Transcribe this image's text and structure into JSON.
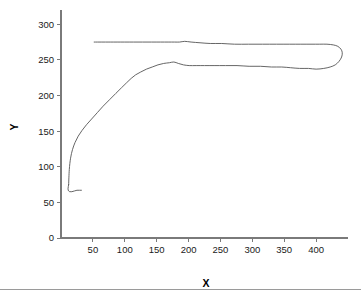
{
  "chart_data": {
    "type": "line",
    "title": "",
    "subtitle": "",
    "xlabel": "X",
    "ylabel": "Y",
    "xlim": [
      0,
      450
    ],
    "ylim": [
      0,
      320
    ],
    "grid": false,
    "legend": null,
    "legend_position": "none",
    "xticks": [
      50,
      100,
      150,
      200,
      250,
      300,
      350,
      400
    ],
    "xtick_labels": [
      "50",
      "100",
      "150",
      "200",
      "250",
      "300",
      "350",
      "400"
    ],
    "yticks": [
      0,
      50,
      100,
      150,
      200,
      250,
      300
    ],
    "ytick_labels": [
      "0",
      "50",
      "100",
      "150",
      "200",
      "250",
      "300"
    ],
    "series": [
      {
        "name": "loop",
        "closed": false,
        "comment": "Single continuous hysteresis loop traced from lower-left start, up the ascending branch, across the lower plateau, around the right-hand turn, back along the upper plateau to the left, then down to the small bottom-left hook.",
        "points": [
          [
            12,
            75
          ],
          [
            13,
            96
          ],
          [
            15,
            112
          ],
          [
            18,
            124
          ],
          [
            22,
            134
          ],
          [
            27,
            143
          ],
          [
            33,
            151
          ],
          [
            40,
            159
          ],
          [
            48,
            167
          ],
          [
            57,
            176
          ],
          [
            66,
            185
          ],
          [
            76,
            194
          ],
          [
            86,
            203
          ],
          [
            95,
            211
          ],
          [
            103,
            218
          ],
          [
            110,
            224
          ],
          [
            117,
            229
          ],
          [
            125,
            233
          ],
          [
            134,
            237
          ],
          [
            143,
            240
          ],
          [
            152,
            243
          ],
          [
            161,
            245
          ],
          [
            170,
            246
          ],
          [
            177,
            247
          ],
          [
            184,
            245
          ],
          [
            192,
            243
          ],
          [
            201,
            242
          ],
          [
            212,
            242
          ],
          [
            225,
            242
          ],
          [
            240,
            242
          ],
          [
            258,
            242
          ],
          [
            276,
            242
          ],
          [
            295,
            241
          ],
          [
            313,
            241
          ],
          [
            330,
            240
          ],
          [
            346,
            240
          ],
          [
            360,
            239
          ],
          [
            374,
            238
          ],
          [
            388,
            238
          ],
          [
            400,
            237
          ],
          [
            412,
            238
          ],
          [
            422,
            240
          ],
          [
            430,
            243
          ],
          [
            436,
            248
          ],
          [
            440,
            254
          ],
          [
            441,
            260
          ],
          [
            439,
            265
          ],
          [
            434,
            269
          ],
          [
            427,
            271
          ],
          [
            417,
            272
          ],
          [
            405,
            272
          ],
          [
            392,
            272
          ],
          [
            376,
            272
          ],
          [
            358,
            272
          ],
          [
            338,
            272
          ],
          [
            316,
            272
          ],
          [
            294,
            272
          ],
          [
            272,
            272
          ],
          [
            252,
            273
          ],
          [
            234,
            273
          ],
          [
            218,
            274
          ],
          [
            204,
            275
          ],
          [
            194,
            276
          ],
          [
            186,
            275
          ],
          [
            178,
            275
          ],
          [
            168,
            275
          ],
          [
            156,
            275
          ],
          [
            142,
            275
          ],
          [
            128,
            275
          ],
          [
            114,
            275
          ],
          [
            100,
            275
          ],
          [
            88,
            275
          ],
          [
            78,
            275
          ],
          [
            70,
            275
          ],
          [
            63,
            275
          ],
          [
            57,
            275
          ],
          [
            52,
            275
          ]
        ],
        "hook_points": [
          [
            12,
            75
          ],
          [
            11,
            69
          ],
          [
            12,
            66
          ],
          [
            14,
            65
          ],
          [
            17,
            65
          ],
          [
            21,
            66
          ],
          [
            25,
            67
          ],
          [
            29,
            67
          ],
          [
            32,
            67
          ]
        ]
      }
    ]
  },
  "figure": {
    "background_color": "#ffffff",
    "line_color": "#555555",
    "axis_color": "#7a7a7a",
    "text_color": "#1a1a1a",
    "footer_rule_color": "#9a9a9a"
  }
}
